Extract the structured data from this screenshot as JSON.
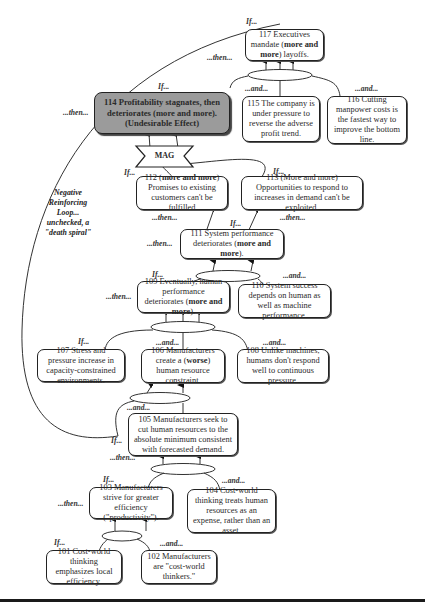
{
  "diagram": {
    "type": "current-reality-tree",
    "nodes": {
      "n117": {
        "pre": "117 Executives mandate (",
        "bold": "more and more",
        "post": ") layoffs."
      },
      "n114": {
        "text": "114 Profitability stagnates, then deteriorates (more and more). (Undesirable Effect)"
      },
      "n115": {
        "text": "115 The company is under pressure to reverse the adverse profit trend."
      },
      "n116": {
        "text": "116 Cutting manpower costs is the fastest way to improve the bottom line."
      },
      "n112": {
        "pre": "112 (",
        "bold": "more and more",
        "post": ") Promises to existing customers can't be fulfilled"
      },
      "n113": {
        "text": "113 (More and more) Opportunities to respond to increases in demand can't be exploited."
      },
      "n111": {
        "pre": "111 System performance deteriorates (",
        "bold": "more and more",
        "post": ")."
      },
      "n109": {
        "pre": "109 Eventually, human performance deteriorates (",
        "bold": "more and more",
        "post": ")."
      },
      "n110": {
        "text": "110 System success depends on human as well as machine performance."
      },
      "n107": {
        "text": "107 Stress and pressure increase in capacity-constrained environments."
      },
      "n106": {
        "pre": "106 Manufacturers create a (",
        "bold": "worse",
        "post": ") human resource constraint."
      },
      "n108": {
        "text": "108 Unlike machines, humans don't respond well to continuous pressure."
      },
      "n105": {
        "text": "105 Manufacturers seek to cut human resources to the absolute minimum consistent with forecasted demand."
      },
      "n103": {
        "text": "103 Manufacturers strive for greater efficiency (\"productivity\")."
      },
      "n104": {
        "text": "104 Cost-world thinking treats human resources as an expense, rather than an asset."
      },
      "n101": {
        "text": "101 Cost-world thinking emphasizes local efficiency."
      },
      "n102": {
        "text": "102 Manufacturers are \"cost-world thinkers.\""
      }
    },
    "mag_label": "MAG",
    "connectors": {
      "if": "If...",
      "then": "...then...",
      "and": "...and..."
    },
    "loop_note": "Negative Reinforcing Loop... unchecked, a \"death spiral\""
  }
}
